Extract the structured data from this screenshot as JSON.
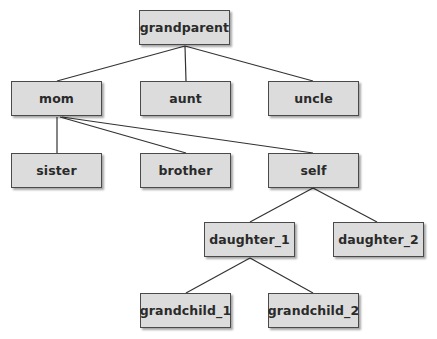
{
  "diagram": {
    "colors": {
      "node_fill": "#dcdcdc",
      "node_border": "#4a4a4a",
      "edge": "#333333",
      "text": "#2a2a2a"
    },
    "nodes": [
      {
        "id": "grandparent",
        "label": "grandparent",
        "x": 139,
        "y": 10
      },
      {
        "id": "mom",
        "label": "mom",
        "x": 11,
        "y": 81
      },
      {
        "id": "aunt",
        "label": "aunt",
        "x": 140,
        "y": 81
      },
      {
        "id": "uncle",
        "label": "uncle",
        "x": 268,
        "y": 81
      },
      {
        "id": "sister",
        "label": "sister",
        "x": 11,
        "y": 153
      },
      {
        "id": "brother",
        "label": "brother",
        "x": 140,
        "y": 153
      },
      {
        "id": "self",
        "label": "self",
        "x": 268,
        "y": 153
      },
      {
        "id": "daughter_1",
        "label": "daughter_1",
        "x": 204,
        "y": 222
      },
      {
        "id": "daughter_2",
        "label": "daughter_2",
        "x": 333,
        "y": 222
      },
      {
        "id": "grandchild_1",
        "label": "grandchild_1",
        "x": 140,
        "y": 293
      },
      {
        "id": "grandchild_2",
        "label": "grandchild_2",
        "x": 268,
        "y": 293
      }
    ],
    "edges": [
      [
        "grandparent",
        "mom"
      ],
      [
        "grandparent",
        "aunt"
      ],
      [
        "grandparent",
        "uncle"
      ],
      [
        "mom",
        "sister"
      ],
      [
        "mom",
        "brother"
      ],
      [
        "mom",
        "self"
      ],
      [
        "self",
        "daughter_1"
      ],
      [
        "self",
        "daughter_2"
      ],
      [
        "daughter_1",
        "grandchild_1"
      ],
      [
        "daughter_1",
        "grandchild_2"
      ]
    ]
  }
}
